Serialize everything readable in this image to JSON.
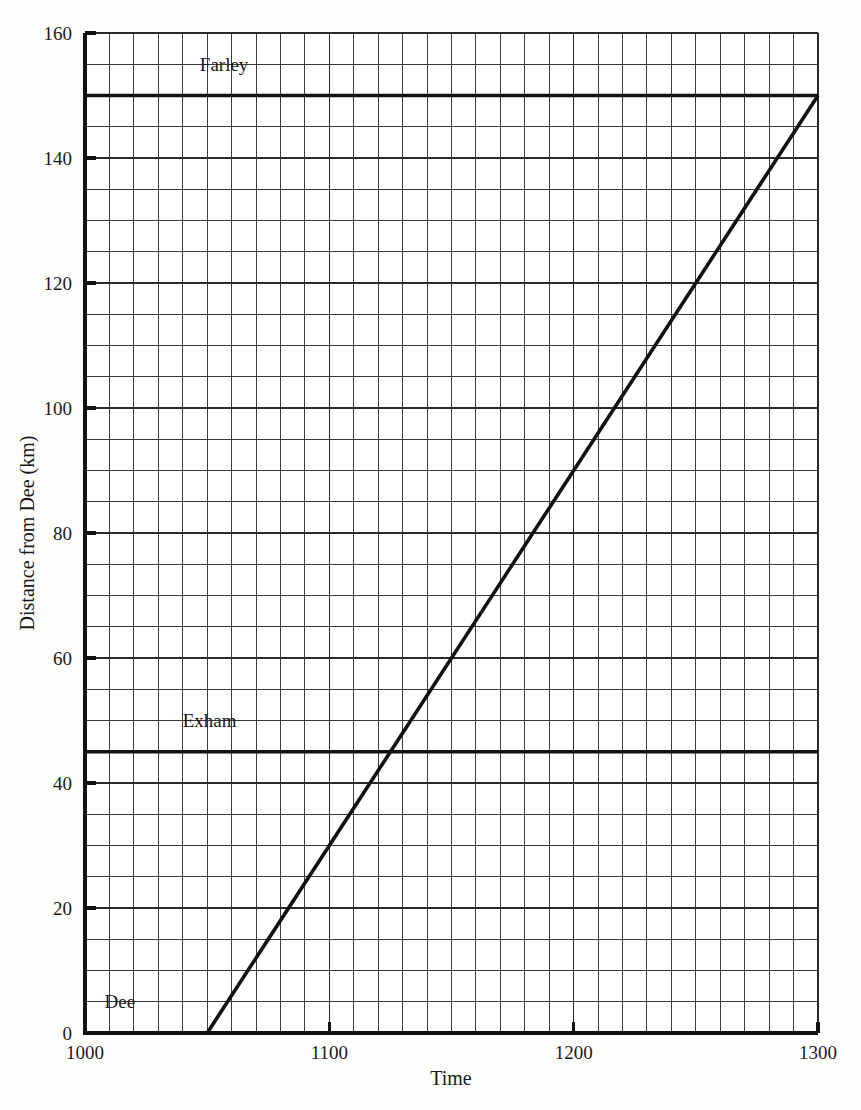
{
  "chart_data": {
    "type": "line",
    "title": "",
    "subtitle": "",
    "xlabel": "Time",
    "ylabel": "Distance from Dee (km)",
    "xlim": [
      1000,
      1300
    ],
    "ylim": [
      0,
      160
    ],
    "grid": true,
    "grid_x_step": 10,
    "grid_y_step": 5,
    "legend_position": "none",
    "x_major_step": 100,
    "y_major_step": 20,
    "x_tick_labels": [
      "1000",
      "1100",
      "1200",
      "1300"
    ],
    "x_tick_values": [
      1000,
      1100,
      1200,
      1300
    ],
    "y_tick_labels": [
      "0",
      "20",
      "40",
      "60",
      "80",
      "100",
      "120",
      "140",
      "160"
    ],
    "y_tick_values": [
      0,
      20,
      40,
      60,
      80,
      100,
      120,
      140,
      160
    ],
    "series": [
      {
        "name": "journey",
        "style": "solid",
        "x": [
          1050,
          1300
        ],
        "y": [
          0,
          150
        ],
        "points": [
          {
            "x": 1050,
            "y": 0
          },
          {
            "x": 1125,
            "y": 45
          },
          {
            "x": 1300,
            "y": 150
          }
        ]
      }
    ],
    "station_lines": [
      {
        "name": "Dee",
        "label": "Dee",
        "y": 0,
        "drawn": false
      },
      {
        "name": "Exham",
        "label": "Exham",
        "y": 45,
        "drawn": true
      },
      {
        "name": "Farley",
        "label": "Farley",
        "y": 150,
        "drawn": true
      }
    ],
    "annotations": [
      {
        "text": "Farley",
        "x": 1047,
        "y": 153
      },
      {
        "text": "Exham",
        "x": 1040,
        "y": 48
      },
      {
        "text": "Dee",
        "x": 1008,
        "y": 3
      }
    ]
  },
  "axes": {
    "x_title": "Time",
    "y_title": "Distance from Dee (km)",
    "x_ticks": [
      {
        "label": "1000",
        "value": 1000
      },
      {
        "label": "1100",
        "value": 1100
      },
      {
        "label": "1200",
        "value": 1200
      },
      {
        "label": "1300",
        "value": 1300
      }
    ],
    "y_ticks": [
      {
        "label": "0",
        "value": 0
      },
      {
        "label": "20",
        "value": 20
      },
      {
        "label": "40",
        "value": 40
      },
      {
        "label": "60",
        "value": 60
      },
      {
        "label": "80",
        "value": 80
      },
      {
        "label": "100",
        "value": 100
      },
      {
        "label": "120",
        "value": 120
      },
      {
        "label": "140",
        "value": 140
      },
      {
        "label": "160",
        "value": 160
      }
    ]
  },
  "labels": {
    "farley": "Farley",
    "exham": "Exham",
    "dee": "Dee"
  },
  "colors": {
    "ink": "#111111",
    "grid_minor": "#3b3b3b",
    "grid_major": "#2a2a2a",
    "background": "#fdfdfc"
  }
}
